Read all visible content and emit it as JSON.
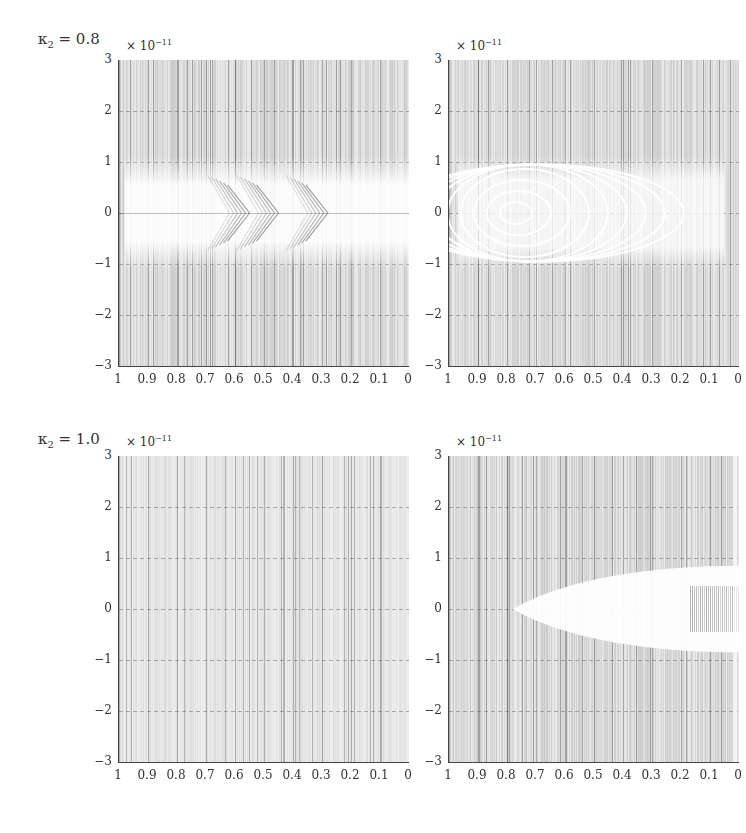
{
  "figure": {
    "rows": [
      {
        "label_symbol": "κ",
        "label_sub": "2",
        "label_value": "= 0.8"
      },
      {
        "label_symbol": "κ",
        "label_sub": "2",
        "label_value": "= 1.0"
      }
    ],
    "axis_multiplier": {
      "base": "× 10",
      "exponent": "−11"
    },
    "y_ticks": [
      "3",
      "2",
      "1",
      "0",
      "−1",
      "−2",
      "−3"
    ],
    "x_ticks": [
      "1",
      "0.9",
      "0.8",
      "0.7",
      "0.6",
      "0.5",
      "0.4",
      "0.3",
      "0.2",
      "0.1",
      "0"
    ]
  },
  "chart_data": [
    {
      "type": "heatmap",
      "title": "κ2 = 0.8 (left)",
      "xlabel": "",
      "ylabel": "",
      "xlim": [
        1,
        0
      ],
      "ylim": [
        -3,
        3
      ],
      "y_scale": "×10^-11",
      "x_ticks": [
        1,
        0.9,
        0.8,
        0.7,
        0.6,
        0.5,
        0.4,
        0.3,
        0.2,
        0.1,
        0
      ],
      "y_ticks": [
        3,
        2,
        1,
        0,
        -1,
        -2,
        -3
      ],
      "grid": true,
      "description": "Dense vertical striations; white region centered at y=0 spanning roughly y=-1..1 with nested chevron (arrow) patterns pointing right near x≈0.55, 0.45, 0.28"
    },
    {
      "type": "heatmap",
      "title": "κ2 = 0.8 (right)",
      "xlim": [
        1,
        0
      ],
      "ylim": [
        -3,
        3
      ],
      "y_scale": "×10^-11",
      "x_ticks": [
        1,
        0.9,
        0.8,
        0.7,
        0.6,
        0.5,
        0.4,
        0.3,
        0.2,
        0.1,
        0
      ],
      "y_ticks": [
        3,
        2,
        1,
        0,
        -1,
        -2,
        -3
      ],
      "grid": true,
      "description": "Concentric elliptical white rings centered near x≈0.8, y=0, extending to x≈0.2 within y≈-1..1"
    },
    {
      "type": "heatmap",
      "title": "κ2 = 1.0 (left)",
      "xlim": [
        1,
        0
      ],
      "ylim": [
        -3,
        3
      ],
      "y_scale": "×10^-11",
      "x_ticks": [
        1,
        0.9,
        0.8,
        0.7,
        0.6,
        0.5,
        0.4,
        0.3,
        0.2,
        0.1,
        0
      ],
      "y_ticks": [
        3,
        2,
        1,
        0,
        -1,
        -2,
        -3
      ],
      "grid": true,
      "description": "Uniform light vertical striations, no structure"
    },
    {
      "type": "heatmap",
      "title": "κ2 = 1.0 (right)",
      "xlim": [
        1,
        0
      ],
      "ylim": [
        -3,
        3
      ],
      "y_scale": "×10^-11",
      "x_ticks": [
        1,
        0.9,
        0.8,
        0.7,
        0.6,
        0.5,
        0.4,
        0.3,
        0.2,
        0.1,
        0
      ],
      "y_ticks": [
        3,
        2,
        1,
        0,
        -1,
        -2,
        -3
      ],
      "grid": true,
      "description": "White wedge opening from x≈0.75 toward x=0 within y≈-0.8..0.8, with darker striations near x≈0.15..0 around y=0"
    }
  ]
}
